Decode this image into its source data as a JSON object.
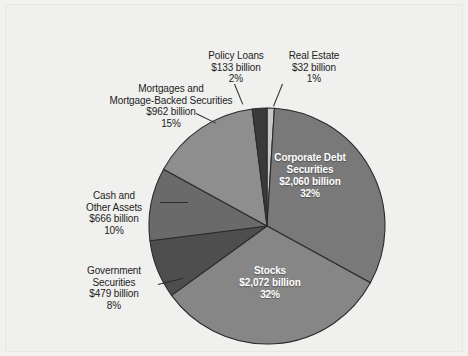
{
  "chart_data": {
    "type": "pie",
    "title": "",
    "subtitle": "",
    "xlabel": "",
    "ylabel": "",
    "units": "billion USD",
    "legend_position": "none",
    "grid": false,
    "label_order_clockwise_from_top": [
      "Real Estate",
      "Corporate Debt Securities",
      "Stocks",
      "Government Securities",
      "Cash and Other Assets",
      "Mortgages and Mortgage-Backed Securities",
      "Policy Loans"
    ],
    "categories": [
      "Real Estate",
      "Corporate Debt Securities",
      "Stocks",
      "Government Securities",
      "Cash and Other Assets",
      "Mortgages and Mortgage-Backed Securities",
      "Policy Loans"
    ],
    "values": [
      32,
      2060,
      2072,
      479,
      666,
      962,
      133
    ],
    "percentages": [
      1,
      32,
      32,
      8,
      10,
      15,
      2
    ],
    "slices": [
      {
        "name": "Real Estate",
        "name_line1": "Real Estate",
        "name_line2": "",
        "value_label": "$32 billion",
        "percent_label": "1%",
        "value": 32,
        "percent": 1,
        "color": "#c9c9c7",
        "label_placement": "outside"
      },
      {
        "name": "Corporate Debt Securities",
        "name_line1": "Corporate Debt",
        "name_line2": "Securities",
        "value_label": "$2,060 billion",
        "percent_label": "32%",
        "value": 2060,
        "percent": 32,
        "color": "#797979",
        "label_placement": "inside"
      },
      {
        "name": "Stocks",
        "name_line1": "Stocks",
        "name_line2": "",
        "value_label": "$2,072 billion",
        "percent_label": "32%",
        "value": 2072,
        "percent": 32,
        "color": "#868686",
        "label_placement": "inside"
      },
      {
        "name": "Government Securities",
        "name_line1": "Government",
        "name_line2": "Securities",
        "value_label": "$479 billion",
        "percent_label": "8%",
        "value": 479,
        "percent": 8,
        "color": "#4e4e4e",
        "label_placement": "outside"
      },
      {
        "name": "Cash and Other Assets",
        "name_line1": "Cash and",
        "name_line2": "Other Assets",
        "value_label": "$666 billion",
        "percent_label": "10%",
        "value": 666,
        "percent": 10,
        "color": "#6a6a6a",
        "label_placement": "outside"
      },
      {
        "name": "Mortgages and Mortgage-Backed Securities",
        "name_line1": "Mortgages and",
        "name_line2": "Mortgage-Backed Securities",
        "value_label": "$962 billion",
        "percent_label": "15%",
        "value": 962,
        "percent": 15,
        "color": "#8e8e8e",
        "label_placement": "outside"
      },
      {
        "name": "Policy Loans",
        "name_line1": "Policy Loans",
        "name_line2": "",
        "value_label": "$133 billion",
        "percent_label": "2%",
        "value": 133,
        "percent": 2,
        "color": "#3a3a3a",
        "label_placement": "outside"
      }
    ],
    "total_value": 6404,
    "geometry": {
      "center_x": 267,
      "center_y": 226,
      "radius": 118,
      "start_angle_deg": -90,
      "direction": "clockwise"
    },
    "colors": {
      "background": "#f1f1ef",
      "slice_outline": "#2b2b2b",
      "inside_label_text": "#ffffff",
      "outside_label_text": "#232323"
    }
  }
}
